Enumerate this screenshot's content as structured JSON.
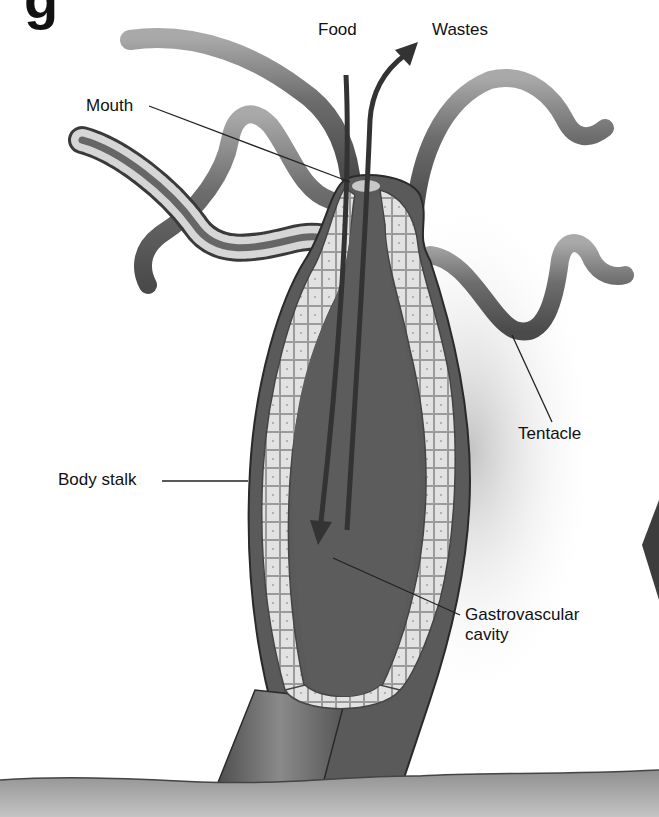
{
  "figure": {
    "heading_fragment": "g",
    "labels": {
      "food": "Food",
      "wastes": "Wastes",
      "mouth": "Mouth",
      "tentacle": "Tentacle",
      "body_stalk": "Body stalk",
      "gastrovascular_line1": "Gastrovascular",
      "gastrovascular_line2": "cavity"
    },
    "arrows": [
      {
        "name": "food-arrow",
        "direction": "down",
        "meaning": "Food enters through mouth"
      },
      {
        "name": "wastes-arrow",
        "direction": "up",
        "meaning": "Wastes exit through mouth"
      }
    ],
    "colors": {
      "background": "#ffffff",
      "tentacle": "#6e6e6e",
      "cell_layer": "#d9d9d9",
      "cavity": "#5a5a5a",
      "outline": "#2a2a2a",
      "ground": "#9a9a9a"
    }
  }
}
